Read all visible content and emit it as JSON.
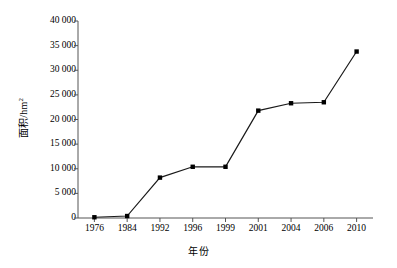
{
  "chart_data": {
    "type": "line",
    "title": "",
    "xlabel": "年份",
    "ylabel": "面积/hm²",
    "ylabel_base": "面积/hm",
    "ylabel_sup": "2",
    "categories": [
      "1976",
      "1984",
      "1992",
      "1996",
      "1999",
      "2001",
      "2004",
      "2006",
      "2010"
    ],
    "values": [
      150,
      400,
      8200,
      10400,
      10400,
      21800,
      23300,
      23500,
      33800
    ],
    "ytick_labels": [
      "0",
      "5 000",
      "10 000",
      "15 000",
      "20 000",
      "25 000",
      "30 000",
      "35 000",
      "40 000"
    ],
    "ytick_values": [
      0,
      5000,
      10000,
      15000,
      20000,
      25000,
      30000,
      35000,
      40000
    ],
    "ylim": [
      0,
      40000
    ],
    "grid": false,
    "legend": "none",
    "series": [
      {
        "name": "面积",
        "values": [
          150,
          400,
          8200,
          10400,
          10400,
          21800,
          23300,
          23500,
          33800
        ]
      }
    ],
    "marker": "square",
    "marker_color": "#000000",
    "line_color": "#1a1a1a",
    "axis_color": "#555555",
    "background": "#ffffff"
  }
}
